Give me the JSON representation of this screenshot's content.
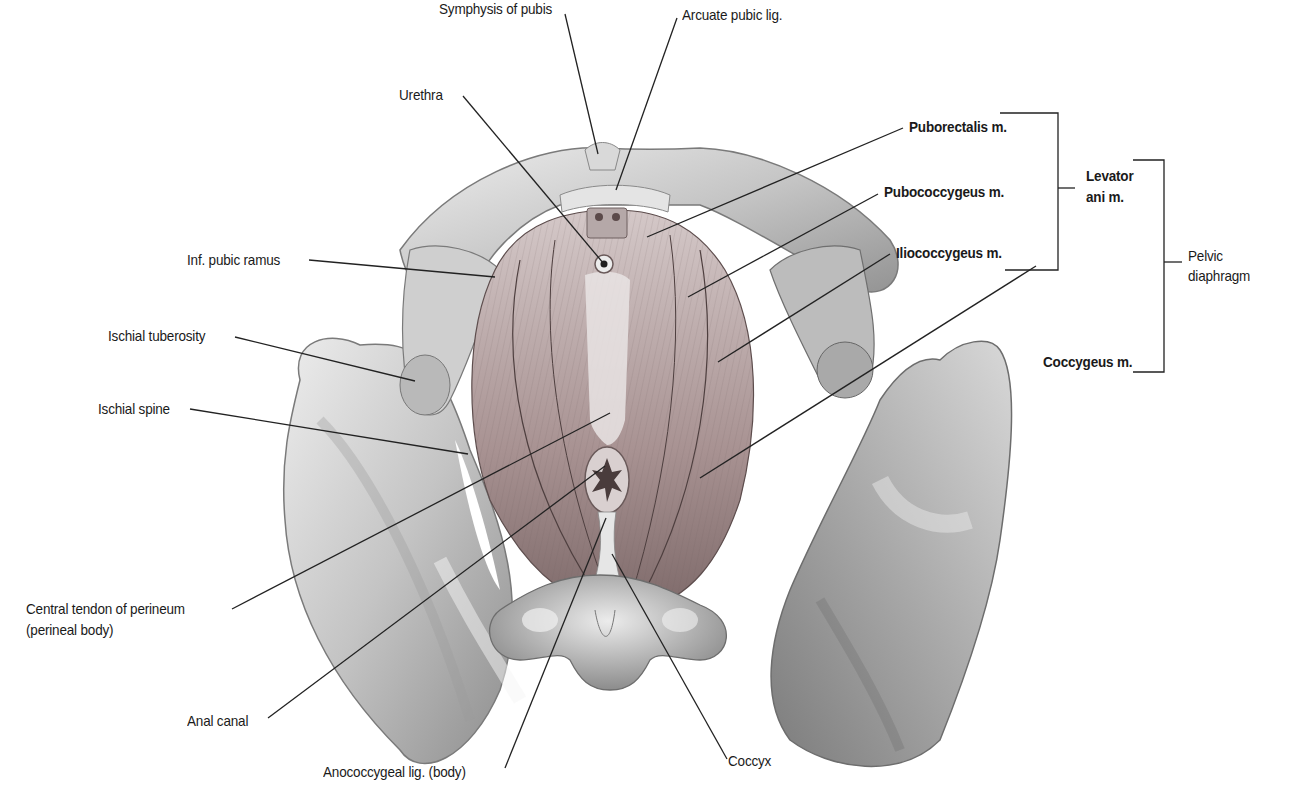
{
  "figure": {
    "colors": {
      "background": "#ffffff",
      "bone_light": "#e6e6e6",
      "bone_mid": "#bdbdbd",
      "bone_dark": "#8a8a8a",
      "muscle_light": "#c9b9b9",
      "muscle_dark": "#8a7474",
      "leader_line": "#222222",
      "text": "#1a1a1a"
    }
  },
  "labels": {
    "symphysis": "Symphysis of pubis",
    "arcuate": "Arcuate pubic lig.",
    "urethra": "Urethra",
    "inf_pubic_ramus": "Inf. pubic ramus",
    "ischial_tuberosity": "Ischial tuberosity",
    "ischial_spine": "Ischial spine",
    "central_tendon_1": "Central tendon of perineum",
    "central_tendon_2": "(perineal body)",
    "anal_canal": "Anal canal",
    "anococcygeal": "Anococcygeal lig. (body)",
    "coccyx": "Coccyx",
    "puborectalis": "Puborectalis m.",
    "pubococcygeus": "Pubococcygeus m.",
    "iliococcygeus": "Iliococcygeus m.",
    "coccygeus": "Coccygeus m.",
    "levator_1": "Levator",
    "levator_2": "ani m.",
    "pelvic_1": "Pelvic",
    "pelvic_2": "diaphragm"
  },
  "groups": {
    "levator_ani": [
      "Puborectalis m.",
      "Pubococcygeus m.",
      "Iliococcygeus m."
    ],
    "pelvic_diaphragm": [
      "Levator ani m.",
      "Coccygeus m."
    ]
  }
}
